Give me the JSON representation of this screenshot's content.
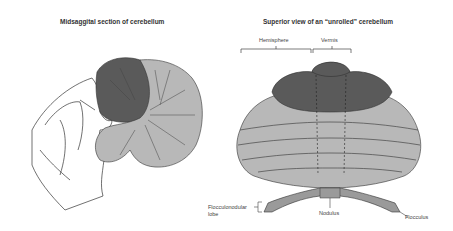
{
  "left_panel": {
    "title": "Midsaggital section of cerebellum"
  },
  "right_panel": {
    "title": "Superior view of an “unrolled” cerebellum",
    "labels": {
      "hemisphere": "Hemisphere",
      "vermis": "Vermis",
      "flocculonodular_line1": "Flocculonodular",
      "flocculonodular_line2": "lobe",
      "nodulus": "Nodulus",
      "flocculus": "Flocculus"
    }
  },
  "colors": {
    "dark_lobe": "#5a5a5a",
    "light_lobe": "#b8b8b8",
    "outline": "#333333",
    "background": "#ffffff"
  }
}
